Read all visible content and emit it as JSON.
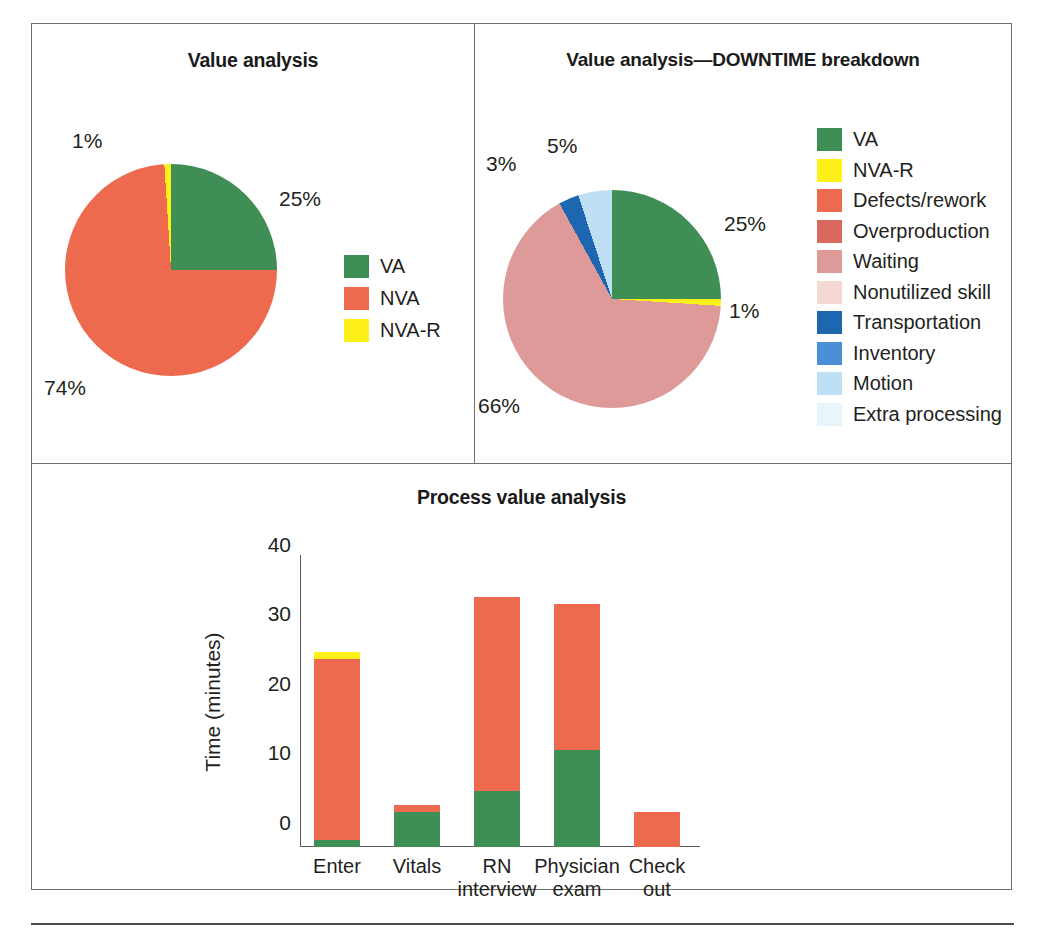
{
  "colors": {
    "va_green": "#3e8e56",
    "nva_orange": "#ed6a4e",
    "nva_r_yellow": "#fdf119",
    "defects_rework": "#ed6a4e",
    "overproduction": "#d9685f",
    "waiting": "#dd9a99",
    "nonutilized_skill": "#f5d7d4",
    "transportation": "#1d66b0",
    "inventory": "#4a8fd8",
    "motion": "#bfe0f4",
    "extra_processing": "#e8f5fb",
    "border": "#6e6e6e",
    "axis": "#595959",
    "text": "#231f20"
  },
  "panels": {
    "value_analysis": {
      "title": "Value analysis",
      "pie_labels": [
        {
          "text": "1%",
          "x": 40,
          "y": 105
        },
        {
          "text": "25%",
          "x": 247,
          "y": 163
        },
        {
          "text": "74%",
          "x": 12,
          "y": 352
        }
      ],
      "legend": [
        {
          "label": "VA",
          "color_key": "va_green"
        },
        {
          "label": "NVA",
          "color_key": "nva_orange"
        },
        {
          "label": "NVA-R",
          "color_key": "nva_r_yellow"
        }
      ]
    },
    "downtime": {
      "title": "Value analysis—DOWNTIME breakdown",
      "pie_labels": [
        {
          "text": "3%",
          "x": 11,
          "y": 128
        },
        {
          "text": "5%",
          "x": 72,
          "y": 110
        },
        {
          "text": "25%",
          "x": 249,
          "y": 188
        },
        {
          "text": "1%",
          "x": 254,
          "y": 275
        },
        {
          "text": "66%",
          "x": 3,
          "y": 370
        }
      ],
      "legend": [
        {
          "label": "VA",
          "color_key": "va_green"
        },
        {
          "label": "NVA-R",
          "color_key": "nva_r_yellow"
        },
        {
          "label": "Defects/rework",
          "color_key": "defects_rework"
        },
        {
          "label": "Overproduction",
          "color_key": "overproduction"
        },
        {
          "label": "Waiting",
          "color_key": "waiting"
        },
        {
          "label": "Nonutilized skill",
          "color_key": "nonutilized_skill"
        },
        {
          "label": "Transportation",
          "color_key": "transportation"
        },
        {
          "label": "Inventory",
          "color_key": "inventory"
        },
        {
          "label": "Motion",
          "color_key": "motion"
        },
        {
          "label": "Extra processing",
          "color_key": "extra_processing"
        }
      ]
    },
    "process": {
      "title": "Process value analysis",
      "legend": [
        {
          "label": "VA",
          "color_key": "va_green"
        },
        {
          "label": "NVA",
          "color_key": "nva_orange"
        },
        {
          "label": "NVA-R",
          "color_key": "nva_r_yellow"
        }
      ]
    }
  },
  "chart_data": [
    {
      "type": "pie",
      "title": "Value analysis",
      "labels": [
        "VA",
        "NVA",
        "NVA-R"
      ],
      "values": [
        25,
        74,
        1
      ],
      "data_labels": [
        "25%",
        "74%",
        "1%"
      ],
      "colors": [
        "#3e8e56",
        "#ed6a4e",
        "#fdf119"
      ],
      "legend_position": "right",
      "start_angle_deg": 0,
      "direction": "clockwise"
    },
    {
      "type": "pie",
      "title": "Value analysis—DOWNTIME breakdown",
      "labels": [
        "VA",
        "NVA-R",
        "Waiting",
        "Transportation",
        "Motion"
      ],
      "values": [
        25,
        1,
        66,
        3,
        5
      ],
      "data_labels": [
        "25%",
        "1%",
        "66%",
        "3%",
        "5%"
      ],
      "colors": [
        "#3e8e56",
        "#fdf119",
        "#dd9a99",
        "#1d66b0",
        "#bfe0f4"
      ],
      "legend_entries": [
        "VA",
        "NVA-R",
        "Defects/rework",
        "Overproduction",
        "Waiting",
        "Nonutilized skill",
        "Transportation",
        "Inventory",
        "Motion",
        "Extra processing"
      ],
      "legend_colors": [
        "#3e8e56",
        "#fdf119",
        "#ed6a4e",
        "#d9685f",
        "#dd9a99",
        "#f5d7d4",
        "#1d66b0",
        "#4a8fd8",
        "#bfe0f4",
        "#e8f5fb"
      ],
      "legend_position": "right",
      "start_angle_deg": 0,
      "direction": "clockwise"
    },
    {
      "type": "bar",
      "subtype": "stacked",
      "title": "Process value analysis",
      "categories": [
        "Enter",
        "Vitals",
        "RN interview",
        "Physician exam",
        "Check out"
      ],
      "category_lines": [
        [
          "Enter"
        ],
        [
          "Vitals"
        ],
        [
          "RN",
          "interview"
        ],
        [
          "Physician",
          "exam"
        ],
        [
          "Check",
          "out"
        ]
      ],
      "series": [
        {
          "name": "VA",
          "color": "#3e8e56",
          "values": [
            1,
            5,
            8,
            14,
            0
          ]
        },
        {
          "name": "NVA",
          "color": "#ed6a4e",
          "values": [
            26,
            1,
            28,
            21,
            5
          ]
        },
        {
          "name": "NVA-R",
          "color": "#fdf119",
          "values": [
            1,
            0,
            0,
            0,
            0
          ]
        }
      ],
      "totals": [
        28,
        6,
        36,
        35,
        5
      ],
      "xlabel": "",
      "ylabel": "Time (minutes)",
      "ylim": [
        0,
        42
      ],
      "yticks": [
        0,
        10,
        20,
        30,
        40
      ],
      "ytick_labels": [
        "0",
        "10",
        "20",
        "30",
        "40"
      ],
      "grid": false,
      "legend_position": "right"
    }
  ]
}
